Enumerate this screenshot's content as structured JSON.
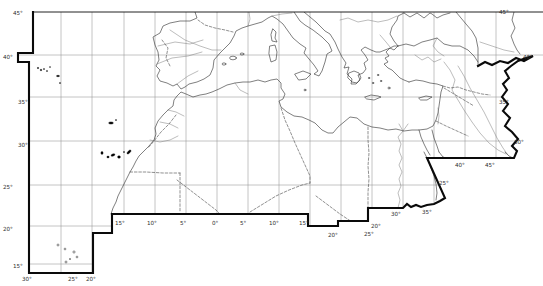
{
  "figure": {
    "type": "outline-base-map",
    "region": "North Africa, Mediterranean Basin and Middle East with 5-degree graticule",
    "background": "#ffffff",
    "colors": {
      "boundary": "#0a0a0a",
      "coastline": "#3a3a3a",
      "graticule": "#8f8f8f",
      "river": "#7a7a7a",
      "dashed_border": "#474747",
      "island_fill": "#000000"
    },
    "graticule_labels": [
      {
        "text": "45°",
        "position": "top-left-corner"
      },
      {
        "text": "40°",
        "position": "left-edge"
      },
      {
        "text": "35°",
        "position": "left-edge"
      },
      {
        "text": "30°",
        "position": "left-edge"
      },
      {
        "text": "25°",
        "position": "left-edge"
      },
      {
        "text": "20°",
        "position": "left-edge"
      },
      {
        "text": "15°",
        "position": "left-edge"
      },
      {
        "text": "30°",
        "position": "bottom-left-edge"
      },
      {
        "text": "25°",
        "position": "bottom-left-edge"
      },
      {
        "text": "20°",
        "position": "bottom-left-edge"
      },
      {
        "text": "15°",
        "position": "south-edge"
      },
      {
        "text": "10°",
        "position": "south-edge"
      },
      {
        "text": "5°",
        "position": "south-edge"
      },
      {
        "text": "0°",
        "position": "south-edge"
      },
      {
        "text": "5°",
        "position": "south-edge"
      },
      {
        "text": "10°",
        "position": "south-edge"
      },
      {
        "text": "15°",
        "position": "south-edge"
      },
      {
        "text": "20°",
        "position": "south-edge-step"
      },
      {
        "text": "20°",
        "position": "southeast-corner-step"
      },
      {
        "text": "25°",
        "position": "southeast-corner-step"
      },
      {
        "text": "30°",
        "position": "egypt-south-edge"
      },
      {
        "text": "35°",
        "position": "egypt-south-edge"
      },
      {
        "text": "25°",
        "position": "red-sea-diagonal"
      },
      {
        "text": "40°",
        "position": "southeast-horizontal-edge"
      },
      {
        "text": "45°",
        "position": "southeast-horizontal-edge"
      },
      {
        "text": "30°",
        "position": "right-edge"
      },
      {
        "text": "35°",
        "position": "right-edge"
      },
      {
        "text": "40°",
        "position": "right-edge"
      },
      {
        "text": "45°",
        "position": "top-right-corner"
      }
    ]
  }
}
